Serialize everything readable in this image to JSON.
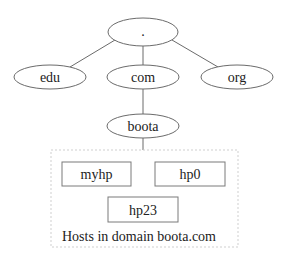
{
  "diagram": {
    "root": {
      "label": "."
    },
    "tlds": [
      {
        "label": "edu"
      },
      {
        "label": "com"
      },
      {
        "label": "org"
      }
    ],
    "subdomain": {
      "label": "boota"
    },
    "hosts": [
      {
        "label": "myhp"
      },
      {
        "label": "hp0"
      },
      {
        "label": "hp23"
      }
    ],
    "group_caption": "Hosts in domain boota.com",
    "colors": {
      "line": "#6b6b6b",
      "text": "#222222",
      "dashed_border": "#cfcfcf",
      "background": "#ffffff"
    }
  }
}
